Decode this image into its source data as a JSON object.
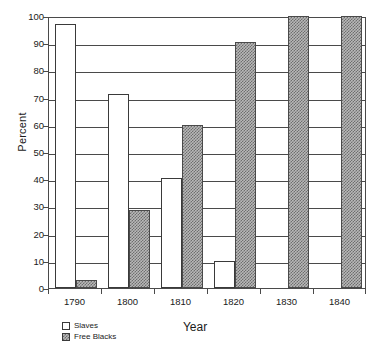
{
  "chart_data": {
    "type": "bar",
    "title": "",
    "xlabel": "Year",
    "ylabel": "Percent",
    "categories": [
      "1790",
      "1800",
      "1810",
      "1820",
      "1830",
      "1840"
    ],
    "series": [
      {
        "name": "Slaves",
        "values": [
          97,
          71.5,
          40.5,
          10,
          0,
          0
        ],
        "fill": "white",
        "color": "#ffffff"
      },
      {
        "name": "Free Blacks",
        "values": [
          3,
          28.5,
          60,
          90.5,
          100,
          100
        ],
        "fill": "hatched",
        "color": "#b8b8b8"
      }
    ],
    "ylim": [
      0,
      100
    ],
    "yticks": [
      0,
      10,
      20,
      30,
      40,
      50,
      60,
      70,
      80,
      90,
      100
    ],
    "ytick_labels": [
      "0",
      "10",
      "20",
      "30",
      "40",
      "50",
      "60",
      "70",
      "80",
      "90",
      "100"
    ],
    "grid": true,
    "grid_axis": "y",
    "legend_position": "below-left",
    "legend": [
      "Slaves",
      "Free Blacks"
    ],
    "axis_color": "#4a4a4a"
  }
}
